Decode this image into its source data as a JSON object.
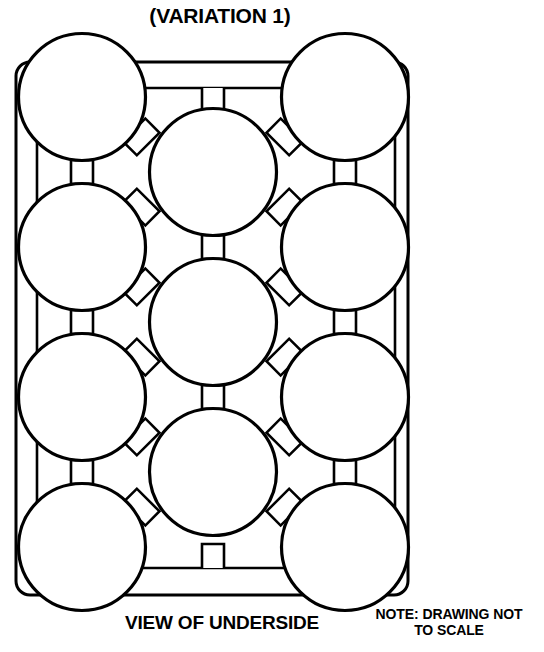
{
  "figure": {
    "title": "(VARIATION 1)",
    "caption": "VIEW OF UNDERSIDE",
    "note_line1": "NOTE: DRAWING NOT",
    "note_line2": "TO SCALE",
    "stroke_color": "#000000",
    "fill_color": "#ffffff",
    "background": "#ffffff"
  },
  "drawing": {
    "type": "technical-line-drawing",
    "subject": "tray underside with circular cup cavities and connecting webs",
    "frame": {
      "outer": {
        "x": 16,
        "y": 62,
        "width": 392,
        "height": 533,
        "corner_radius": 14,
        "stroke_width": 3
      },
      "inner": {
        "x": 37,
        "y": 88,
        "width": 358,
        "height": 480,
        "corner_radius": 6,
        "stroke_width": 2.6
      }
    },
    "circles": {
      "diameter": 127,
      "radius": 63.5,
      "stroke_width": 3.2,
      "left_column": [
        {
          "cx": 82,
          "cy": 97
        },
        {
          "cx": 82,
          "cy": 247
        },
        {
          "cx": 82,
          "cy": 397
        },
        {
          "cx": 82,
          "cy": 547
        }
      ],
      "right_column": [
        {
          "cx": 345,
          "cy": 97
        },
        {
          "cx": 345,
          "cy": 247
        },
        {
          "cx": 345,
          "cy": 397
        },
        {
          "cx": 345,
          "cy": 547
        }
      ],
      "center_column": [
        {
          "cx": 213,
          "cy": 172
        },
        {
          "cx": 213,
          "cy": 322
        },
        {
          "cx": 213,
          "cy": 472
        }
      ],
      "total_count": 11
    },
    "connectors": {
      "vertical_tab_width": 22,
      "vertical_tab_height": 24,
      "diagonal_tab_length": 30,
      "diagonal_tab_width": 20,
      "stroke_width": 2.6,
      "side_vertical": [
        {
          "cx": 82,
          "cy": 172
        },
        {
          "cx": 82,
          "cy": 322
        },
        {
          "cx": 82,
          "cy": 472
        },
        {
          "cx": 345,
          "cy": 172
        },
        {
          "cx": 345,
          "cy": 322
        },
        {
          "cx": 345,
          "cy": 472
        }
      ],
      "center_vertical": [
        {
          "cx": 213,
          "cy": 247
        },
        {
          "cx": 213,
          "cy": 397
        }
      ],
      "frame_stub_top": {
        "cx": 213,
        "y1": 88,
        "y2": 110
      },
      "frame_stub_bottom": {
        "cx": 213,
        "y1": 546,
        "y2": 568
      },
      "diagonals": [
        {
          "from": "center-1",
          "to": "left-1",
          "angle": 225
        },
        {
          "from": "center-1",
          "to": "right-1",
          "angle": 315
        },
        {
          "from": "center-1",
          "to": "left-2",
          "angle": 135
        },
        {
          "from": "center-1",
          "to": "right-2",
          "angle": 45
        },
        {
          "from": "center-2",
          "to": "left-2",
          "angle": 225
        },
        {
          "from": "center-2",
          "to": "right-2",
          "angle": 315
        },
        {
          "from": "center-2",
          "to": "left-3",
          "angle": 135
        },
        {
          "from": "center-2",
          "to": "right-3",
          "angle": 45
        },
        {
          "from": "center-3",
          "to": "left-3",
          "angle": 225
        },
        {
          "from": "center-3",
          "to": "right-3",
          "angle": 315
        },
        {
          "from": "center-3",
          "to": "left-4",
          "angle": 135
        },
        {
          "from": "center-3",
          "to": "right-4",
          "angle": 45
        }
      ]
    }
  }
}
